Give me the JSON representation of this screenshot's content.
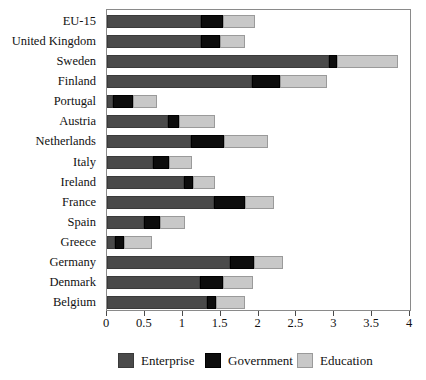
{
  "chart_data": {
    "type": "bar",
    "orientation": "horizontal",
    "stacked": true,
    "title": "",
    "subtitle": "",
    "xlabel": "",
    "ylabel": "",
    "xlim": [
      0,
      4
    ],
    "ylim": null,
    "grid": false,
    "legend_position": "bottom",
    "xticks": [
      0,
      0.5,
      1,
      1.5,
      2,
      2.5,
      3,
      3.5,
      4
    ],
    "xtick_labels": [
      "0",
      "0.5",
      "1",
      "1.5",
      "2",
      "2.5",
      "3",
      "3.5",
      "4"
    ],
    "categories": [
      "EU-15",
      "United Kingdom",
      "Sweden",
      "Finland",
      "Portugal",
      "Austria",
      "Netherlands",
      "Italy",
      "Ireland",
      "France",
      "Spain",
      "Greece",
      "Germany",
      "Denmark",
      "Belgium"
    ],
    "series": [
      {
        "name": "Enterprise",
        "color": "#4a4a4a",
        "values": [
          1.24,
          1.24,
          2.93,
          1.91,
          0.08,
          0.81,
          1.11,
          0.61,
          1.02,
          1.41,
          0.49,
          0.11,
          1.62,
          1.23,
          1.32
        ]
      },
      {
        "name": "Government",
        "color": "#0d0d0d",
        "values": [
          0.29,
          0.25,
          0.11,
          0.38,
          0.26,
          0.14,
          0.44,
          0.21,
          0.11,
          0.41,
          0.21,
          0.12,
          0.32,
          0.3,
          0.12
        ]
      },
      {
        "name": "Education",
        "color": "#c8c8c8",
        "values": [
          0.42,
          0.33,
          0.8,
          0.62,
          0.32,
          0.48,
          0.57,
          0.3,
          0.3,
          0.38,
          0.33,
          0.36,
          0.38,
          0.4,
          0.38
        ]
      }
    ],
    "totals": [
      1.95,
      1.82,
      3.84,
      2.91,
      0.66,
      1.43,
      2.12,
      1.12,
      1.43,
      2.2,
      1.03,
      0.59,
      2.32,
      1.93,
      1.82
    ]
  },
  "legend": {
    "items": [
      {
        "label": "Enterprise",
        "key": "ent"
      },
      {
        "label": "Government",
        "key": "gov"
      },
      {
        "label": "Education",
        "key": "edu"
      }
    ]
  },
  "colors": {
    "enterprise": "#4a4a4a",
    "government": "#0d0d0d",
    "education": "#c8c8c8",
    "axis": "#8a8a8a",
    "background": "#ffffff"
  }
}
